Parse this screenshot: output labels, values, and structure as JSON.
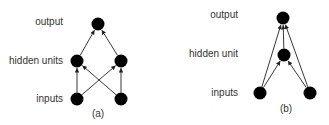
{
  "diagrams": [
    {
      "id": "a",
      "caption": "(a)",
      "layer_labels": {
        "output": "output",
        "hidden": "hidden units",
        "inputs": "inputs"
      },
      "nodes": [
        {
          "id": "out",
          "layer": "output",
          "x": 98,
          "y": 24
        },
        {
          "id": "h1",
          "layer": "hidden",
          "x": 77,
          "y": 61
        },
        {
          "id": "h2",
          "layer": "hidden",
          "x": 121,
          "y": 61
        },
        {
          "id": "i1",
          "layer": "inputs",
          "x": 77,
          "y": 99
        },
        {
          "id": "i2",
          "layer": "inputs",
          "x": 121,
          "y": 99
        }
      ],
      "edges": [
        [
          "i1",
          "h1"
        ],
        [
          "i1",
          "h2"
        ],
        [
          "i2",
          "h1"
        ],
        [
          "i2",
          "h2"
        ],
        [
          "h1",
          "out"
        ],
        [
          "h2",
          "out"
        ]
      ]
    },
    {
      "id": "b",
      "caption": "(b)",
      "layer_labels": {
        "output": "output",
        "hidden": "hidden unit",
        "inputs": "inputs"
      },
      "nodes": [
        {
          "id": "out",
          "layer": "output",
          "x": 283,
          "y": 18
        },
        {
          "id": "h1",
          "layer": "hidden",
          "x": 284,
          "y": 55
        },
        {
          "id": "i1",
          "layer": "inputs",
          "x": 260,
          "y": 93
        },
        {
          "id": "i2",
          "layer": "inputs",
          "x": 310,
          "y": 93
        }
      ],
      "edges": [
        [
          "i1",
          "h1"
        ],
        [
          "i2",
          "h1"
        ],
        [
          "h1",
          "out"
        ],
        [
          "i1",
          "out"
        ],
        [
          "i2",
          "out"
        ]
      ]
    }
  ],
  "colors": {
    "node": "#000000",
    "edge": "#222222",
    "text": "#333333",
    "background": "#ffffff"
  }
}
